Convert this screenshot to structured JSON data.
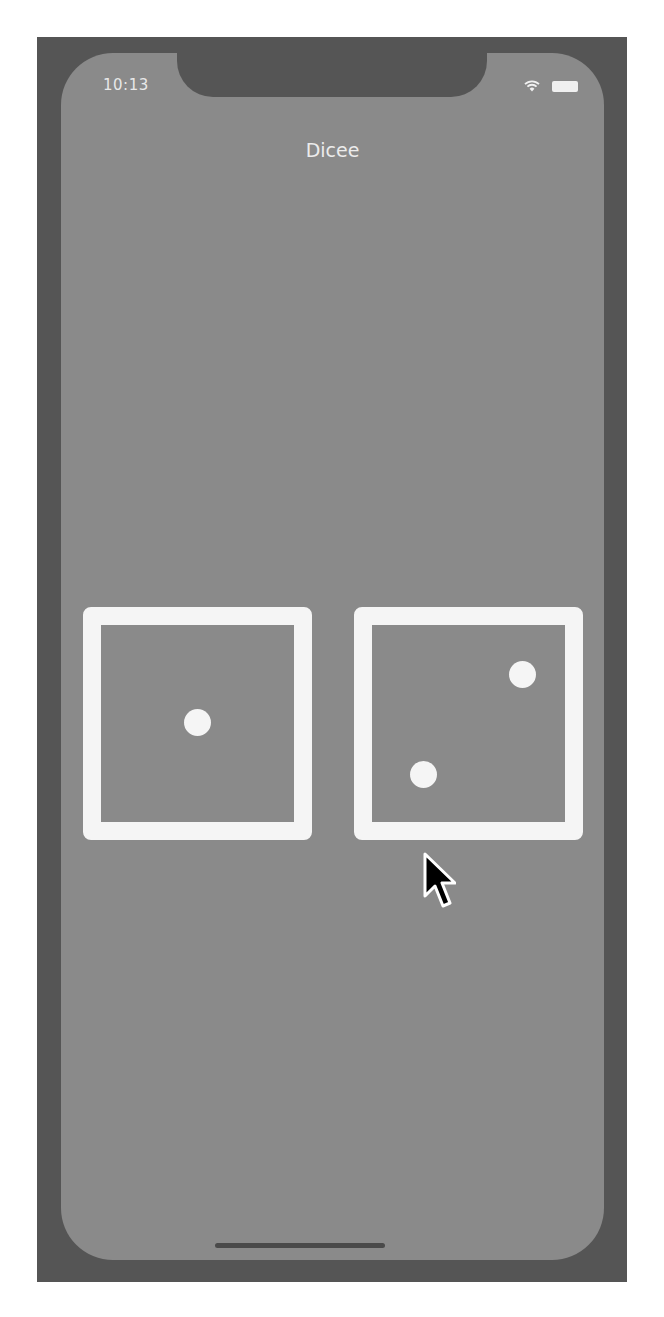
{
  "status_bar": {
    "time": "10:13",
    "icons": [
      "wifi-icon",
      "battery-icon"
    ]
  },
  "app": {
    "title": "Dicee"
  },
  "dice": [
    {
      "name": "left-die",
      "value": 1
    },
    {
      "name": "right-die",
      "value": 2
    }
  ],
  "colors": {
    "device_frame": "#555555",
    "screen_background": "#8a8a8a",
    "die_face": "#f5f5f5",
    "text": "#ececec"
  }
}
